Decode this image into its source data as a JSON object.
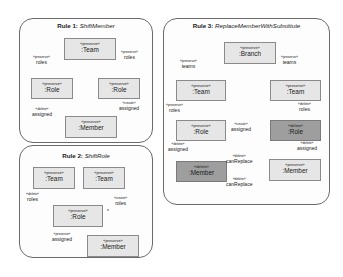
{
  "rules": [
    {
      "title_prefix": "Rule 1:",
      "title_name": "ShiftMember",
      "nodes": [
        {
          "stereotype": "«preserve»",
          "name": ":Team",
          "kind": "preserve"
        },
        {
          "stereotype": "«preserve»",
          "name": ":Role",
          "kind": "preserve"
        },
        {
          "stereotype": "«preserve»",
          "name": ":Role",
          "kind": "preserve"
        },
        {
          "stereotype": "«preserve»",
          "name": ":Member",
          "kind": "preserve"
        }
      ],
      "edges": [
        {
          "stereotype": "«preserve»",
          "name": "roles"
        },
        {
          "stereotype": "«preserve»",
          "name": "roles"
        },
        {
          "stereotype": "«delete»",
          "name": "assigned"
        },
        {
          "stereotype": "«create»",
          "name": "assigned"
        }
      ]
    },
    {
      "title_prefix": "Rule 2:",
      "title_name": "ShiftRole",
      "nodes": [
        {
          "stereotype": "«preserve»",
          "name": ":Team",
          "kind": "preserve"
        },
        {
          "stereotype": "«preserve»",
          "name": ":Team",
          "kind": "preserve"
        },
        {
          "stereotype": "«preserve»",
          "name": ":Role",
          "kind": "preserve"
        },
        {
          "stereotype": "«preserve»",
          "name": ":Member",
          "kind": "preserve"
        }
      ],
      "edges": [
        {
          "stereotype": "«delete»",
          "name": "roles"
        },
        {
          "stereotype": "«create»",
          "name": "roles"
        },
        {
          "stereotype": "«preserve»",
          "name": "assigned"
        }
      ],
      "marker": "*"
    },
    {
      "title_prefix": "Rule 3:",
      "title_name": "ReplaceMemberWithSubstitute",
      "nodes": [
        {
          "stereotype": "«preserve»",
          "name": ":Branch",
          "kind": "preserve"
        },
        {
          "stereotype": "«preserve»",
          "name": ":Team",
          "kind": "preserve"
        },
        {
          "stereotype": "«preserve»",
          "name": ":Team",
          "kind": "preserve"
        },
        {
          "stereotype": "«preserve»",
          "name": ":Role",
          "kind": "preserve"
        },
        {
          "stereotype": "«delete»",
          "name": ":Role",
          "kind": "delete"
        },
        {
          "stereotype": "«delete»",
          "name": ":Member",
          "kind": "delete"
        },
        {
          "stereotype": "«preserve»",
          "name": ":Member",
          "kind": "preserve"
        }
      ],
      "edges": [
        {
          "stereotype": "«preserve»",
          "name": "teams"
        },
        {
          "stereotype": "«preserve»",
          "name": "teams"
        },
        {
          "stereotype": "«preserve»",
          "name": "roles"
        },
        {
          "stereotype": "«delete»",
          "name": "roles"
        },
        {
          "stereotype": "«create»",
          "name": "assigned"
        },
        {
          "stereotype": "«delete»",
          "name": "assigned"
        },
        {
          "stereotype": "«delete»",
          "name": "assigned"
        },
        {
          "stereotype": "«delete»",
          "name": "canReplace"
        },
        {
          "stereotype": "«delete»",
          "name": "canReplace"
        }
      ]
    }
  ],
  "colors": {
    "preserve_fill": "#e6e6e6",
    "delete_fill": "#9e9e9e",
    "edge": "#8a8a8a"
  }
}
